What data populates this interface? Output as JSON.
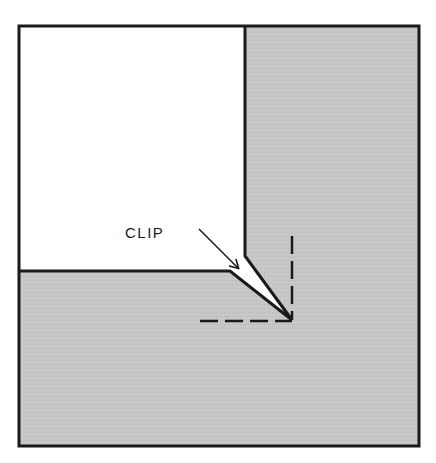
{
  "diagram": {
    "type": "sewing-corner-clip",
    "label": "CLIP",
    "colors": {
      "background": "#ffffff",
      "fabric_under": "#c6c6c6",
      "fabric_top": "#ffffff",
      "line": "#1a1a1a"
    },
    "elements": [
      {
        "name": "outer-frame",
        "description": "square border enclosing diagram"
      },
      {
        "name": "gray-fabric-layer",
        "description": "shaded underlying fabric"
      },
      {
        "name": "white-fabric-layer",
        "description": "top-left white fabric piece with clipped corner"
      },
      {
        "name": "clip-notch",
        "description": "wedge-shaped clip cut toward seam corner"
      },
      {
        "name": "seam-line-vertical",
        "description": "dashed vertical stitching line"
      },
      {
        "name": "seam-line-horizontal",
        "description": "dashed horizontal stitching line"
      },
      {
        "name": "clip-arrow",
        "description": "arrow from CLIP label pointing to notch"
      }
    ]
  }
}
